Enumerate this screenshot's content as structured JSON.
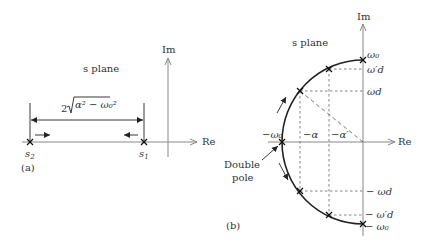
{
  "panel_a": {
    "plane_label": "s plane",
    "im_label": "Im",
    "re_label": "Re",
    "distance_label": "2√(α²−ω₀²)",
    "distance_prefix": "2",
    "distance_radicand": "α² − ω₀²",
    "pole_left": "s",
    "pole_left_sub": "2",
    "pole_right": "s",
    "pole_right_sub": "1",
    "caption": "(a)"
  },
  "panel_b": {
    "plane_label": "s plane",
    "im_label": "Im",
    "re_label": "Re",
    "omega0_top": "ω₀",
    "omega_d_prime_top": "ω′d",
    "omega_d_top": "ωd",
    "omega0_neg": "−ω₀",
    "alpha_neg": "−α",
    "alpha_prime_neg": "−α′",
    "omega_d_bottom": "− ωd",
    "omega_d_prime_bottom": "− ω′d",
    "omega0_bottom": "− ω₀",
    "double_pole_line1": "Double",
    "double_pole_line2": "pole",
    "caption": "(b)"
  }
}
